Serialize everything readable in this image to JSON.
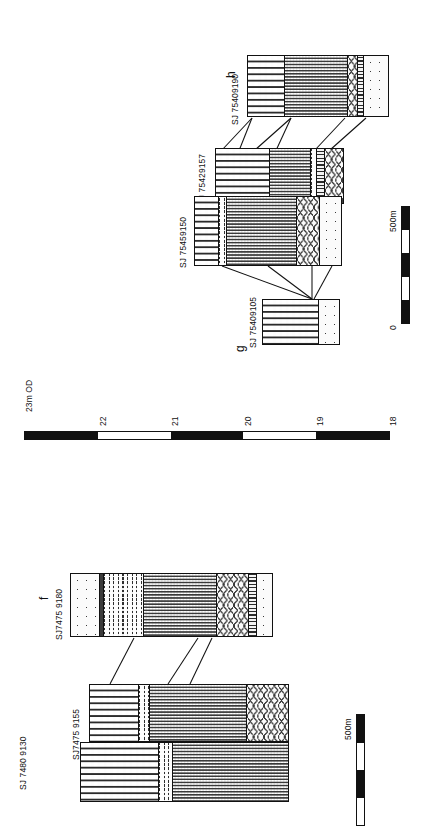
{
  "figure": {
    "type": "geological-cross-section",
    "orientation": "rotated-90"
  },
  "panels": [
    {
      "id": "panel-right",
      "section_labels": {
        "start": "g",
        "end": "h"
      },
      "boreholes": [
        {
          "label": "SJ 75409105"
        },
        {
          "label": "SJ 75459150"
        },
        {
          "label": "SJ 75429157"
        },
        {
          "label": "SJ 75409190"
        }
      ]
    },
    {
      "id": "panel-left",
      "section_labels": {
        "end": "f"
      },
      "boreholes": [
        {
          "label": "SJ 7480 9130"
        },
        {
          "label": "SJ7475 9155"
        },
        {
          "label": "SJ7475 9180"
        }
      ]
    }
  ],
  "elevation_scale": {
    "unit_label": "23m OD",
    "ticks": [
      "23m OD",
      "22",
      "21",
      "20",
      "19",
      "18"
    ],
    "max": 23,
    "min": 18
  },
  "scalebars": [
    {
      "id": "scalebar-right",
      "start": "0",
      "end": "500m",
      "segments": 4
    },
    {
      "id": "scalebar-left",
      "start": "0",
      "end": "500m",
      "segments": 4
    }
  ],
  "legend_patterns": [
    "dash-grid-peat",
    "fine-stipple-sand",
    "sparse-dots-gravel",
    "chevron-till",
    "wavy-laminated",
    "ladder-seam",
    "dark-seam"
  ]
}
